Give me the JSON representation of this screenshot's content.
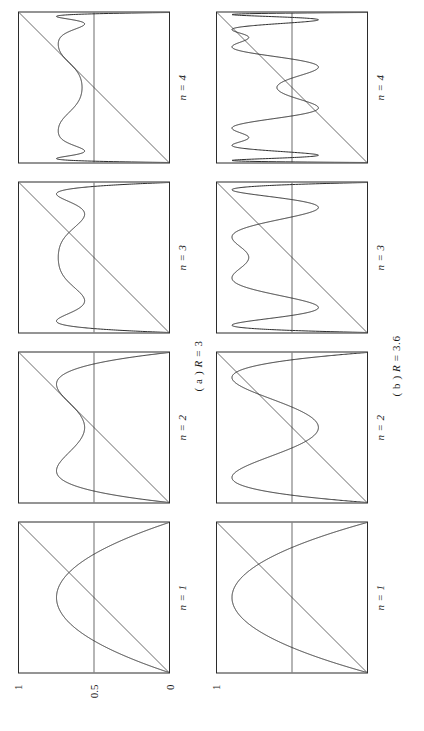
{
  "figure": {
    "orientation_deg": -90,
    "background": "#ffffff",
    "line_color": "#2b2b2b",
    "rows": [
      {
        "id": "row-a",
        "caption_prefix": "( a )",
        "caption_symbol": "R",
        "caption_eq": "=",
        "caption_value": "3",
        "R": 3.0,
        "y_ticks": [
          "1",
          "0.5",
          "0"
        ],
        "panels": [
          {
            "n_label": "n = 1",
            "n": 1
          },
          {
            "n_label": "n = 2",
            "n": 2
          },
          {
            "n_label": "n = 3",
            "n": 3
          },
          {
            "n_label": "n = 4",
            "n": 4
          }
        ]
      },
      {
        "id": "row-b",
        "caption_prefix": "( b )",
        "caption_symbol": "R",
        "caption_eq": "=",
        "caption_value": "3.6",
        "R": 3.6,
        "y_ticks": [
          "1",
          "",
          ""
        ],
        "panels": [
          {
            "n_label": "n = 1",
            "n": 1
          },
          {
            "n_label": "n = 2",
            "n": 2
          },
          {
            "n_label": "n = 3",
            "n": 3
          },
          {
            "n_label": "n = 4",
            "n": 4
          }
        ]
      }
    ]
  },
  "chart_data": {
    "type": "line",
    "title": "",
    "xlabel": "",
    "ylabel": "",
    "xlim": [
      0,
      1
    ],
    "ylim": [
      0,
      1
    ],
    "grid": false,
    "legend": "none",
    "annotations": [
      "( a ) R = 3",
      "( b ) R = 3.6",
      "n = 1",
      "n = 2",
      "n = 3",
      "n = 4"
    ],
    "y_tick_labels": [
      "0",
      "0.5",
      "1"
    ],
    "y_tick_values": [
      0,
      0.5,
      1
    ],
    "x_tick_labels": [],
    "reference_lines": [
      {
        "name": "identity",
        "equation": "y = x",
        "from": [
          0,
          0
        ],
        "to": [
          1,
          1
        ]
      },
      {
        "name": "half-level",
        "equation": "y = 0.5",
        "from": [
          0,
          0.5
        ],
        "to": [
          1,
          0.5
        ]
      }
    ],
    "series": [
      {
        "name": "R=3, n=1",
        "R": 3.0,
        "n": 1,
        "map": "f(x)=3x(1-x)",
        "peak_y": 0.75,
        "peak_x": 0.5
      },
      {
        "name": "R=3, n=2",
        "R": 3.0,
        "n": 2,
        "map": "f^2(x)",
        "peak_y": 0.8,
        "peak_x": 0.5
      },
      {
        "name": "R=3, n=3",
        "R": 3.0,
        "n": 3,
        "map": "f^3(x)",
        "peak_y": 0.82,
        "peak_x": 0.5
      },
      {
        "name": "R=3, n=4",
        "R": 3.0,
        "n": 4,
        "map": "f^4(x)",
        "peak_y": 0.83,
        "peak_x": 0.5
      },
      {
        "name": "R=3.6, n=1",
        "R": 3.6,
        "n": 1,
        "map": "f(x)=3.6x(1-x)",
        "peak_y": 0.9,
        "peak_x": 0.5
      },
      {
        "name": "R=3.6, n=2",
        "R": 3.6,
        "n": 2,
        "map": "f^2(x)",
        "peak_y": 0.9,
        "peak_x": 0.5
      },
      {
        "name": "R=3.6, n=3",
        "R": 3.6,
        "n": 3,
        "map": "f^3(x)",
        "peak_y": 0.9,
        "peak_x": 0.5
      },
      {
        "name": "R=3.6, n=4",
        "R": 3.6,
        "n": 4,
        "map": "f^4(x)",
        "peak_y": 0.9,
        "peak_x": 0.5
      }
    ]
  }
}
